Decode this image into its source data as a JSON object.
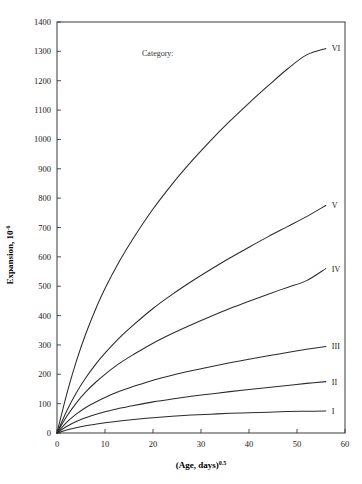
{
  "chart_data": {
    "type": "line",
    "title": "",
    "xlabel": "(Age, days)",
    "xlabel_exponent": "0.5",
    "ylabel": "Expansion, 10",
    "ylabel_exponent": "-6",
    "xlim": [
      0,
      60
    ],
    "ylim": [
      0,
      1400
    ],
    "xticks": [
      0,
      10,
      20,
      30,
      40,
      50,
      60
    ],
    "yticks": [
      0,
      100,
      200,
      300,
      400,
      500,
      600,
      700,
      800,
      900,
      1000,
      1100,
      1200,
      1300,
      1400
    ],
    "grid": false,
    "legend_position": "right-inline",
    "annotations": [
      {
        "text": "Category:",
        "x": 21,
        "y": 1285
      }
    ],
    "x": [
      0,
      2,
      4,
      6,
      8,
      10,
      13,
      16,
      20,
      24,
      28,
      32,
      36,
      40,
      44,
      48,
      52,
      56
    ],
    "series": [
      {
        "name": "I",
        "label": "I",
        "color": "#2b2b2b",
        "end_value": 75,
        "values": [
          0,
          10,
          18,
          25,
          30,
          35,
          41,
          46,
          52,
          57,
          61,
          64,
          67,
          69,
          71,
          73,
          74,
          75
        ]
      },
      {
        "name": "II",
        "label": "II",
        "color": "#2b2b2b",
        "end_value": 175,
        "values": [
          0,
          22,
          39,
          52,
          63,
          72,
          84,
          94,
          106,
          116,
          125,
          133,
          141,
          148,
          155,
          162,
          169,
          175
        ]
      },
      {
        "name": "III",
        "label": "III",
        "color": "#2b2b2b",
        "end_value": 295,
        "values": [
          0,
          36,
          64,
          87,
          105,
          121,
          142,
          159,
          180,
          197,
          212,
          226,
          239,
          251,
          263,
          274,
          285,
          295
        ]
      },
      {
        "name": "IV",
        "label": "IV",
        "color": "#2b2b2b",
        "end_value": 560,
        "values": [
          0,
          56,
          102,
          140,
          172,
          200,
          237,
          268,
          306,
          339,
          369,
          397,
          424,
          449,
          473,
          496,
          519,
          560
        ]
      },
      {
        "name": "V",
        "label": "V",
        "color": "#2b2b2b",
        "end_value": 775,
        "values": [
          0,
          74,
          136,
          188,
          233,
          272,
          324,
          369,
          424,
          472,
          516,
          557,
          596,
          633,
          669,
          703,
          737,
          775
        ]
      },
      {
        "name": "VI",
        "label": "VI",
        "color": "#2b2b2b",
        "end_value": 1310,
        "values": [
          0,
          131,
          243,
          338,
          420,
          492,
          585,
          666,
          763,
          848,
          925,
          996,
          1062,
          1124,
          1183,
          1240,
          1288,
          1310
        ]
      }
    ]
  },
  "axes": {
    "y_tick_labels": [
      "0",
      "100",
      "200",
      "300",
      "400",
      "500",
      "600",
      "700",
      "800",
      "900",
      "1000",
      "1100",
      "1200",
      "1300",
      "1400"
    ],
    "x_tick_labels": [
      "0",
      "10",
      "20",
      "30",
      "40",
      "50",
      "60"
    ]
  }
}
